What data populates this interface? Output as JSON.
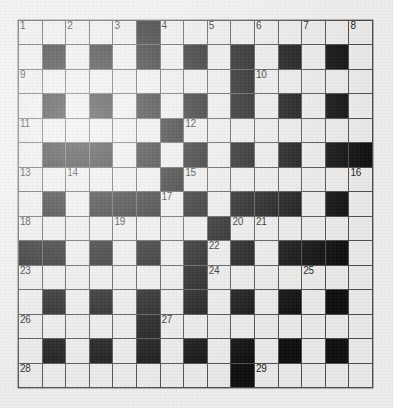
{
  "puzzle": {
    "title": "Crossword Grid",
    "rows": 15,
    "columns": 15,
    "colors": {
      "background": "#f2f1ef",
      "cell_white": "#eeedeb",
      "cell_black": "#0b0b0b",
      "grid_line": "#4a4a4a",
      "number_text": "#161616"
    },
    "grid": [
      [
        "w",
        "w",
        "w",
        "w",
        "w",
        "b",
        "w",
        "w",
        "w",
        "w",
        "w",
        "w",
        "w",
        "w",
        "w"
      ],
      [
        "w",
        "b",
        "w",
        "b",
        "w",
        "b",
        "w",
        "b",
        "w",
        "b",
        "w",
        "b",
        "w",
        "b",
        "w"
      ],
      [
        "w",
        "w",
        "w",
        "w",
        "w",
        "w",
        "w",
        "w",
        "w",
        "b",
        "w",
        "w",
        "w",
        "w",
        "w"
      ],
      [
        "w",
        "b",
        "w",
        "b",
        "w",
        "b",
        "w",
        "b",
        "w",
        "b",
        "w",
        "b",
        "w",
        "b",
        "w"
      ],
      [
        "w",
        "w",
        "w",
        "w",
        "w",
        "w",
        "b",
        "w",
        "w",
        "w",
        "w",
        "w",
        "w",
        "w",
        "w"
      ],
      [
        "w",
        "b",
        "b",
        "b",
        "w",
        "b",
        "w",
        "b",
        "w",
        "b",
        "w",
        "b",
        "w",
        "b",
        "b"
      ],
      [
        "w",
        "w",
        "w",
        "w",
        "w",
        "w",
        "b",
        "w",
        "w",
        "w",
        "w",
        "w",
        "w",
        "w",
        "w"
      ],
      [
        "w",
        "b",
        "w",
        "b",
        "b",
        "b",
        "w",
        "b",
        "w",
        "b",
        "b",
        "b",
        "w",
        "b",
        "w"
      ],
      [
        "w",
        "w",
        "w",
        "w",
        "w",
        "w",
        "w",
        "w",
        "b",
        "w",
        "w",
        "w",
        "w",
        "w",
        "w"
      ],
      [
        "b",
        "b",
        "w",
        "b",
        "w",
        "b",
        "w",
        "b",
        "w",
        "b",
        "w",
        "b",
        "b",
        "b",
        "w"
      ],
      [
        "w",
        "w",
        "w",
        "w",
        "w",
        "w",
        "w",
        "b",
        "w",
        "w",
        "w",
        "w",
        "w",
        "w",
        "w"
      ],
      [
        "w",
        "b",
        "w",
        "b",
        "w",
        "b",
        "w",
        "b",
        "w",
        "b",
        "w",
        "b",
        "w",
        "b",
        "w"
      ],
      [
        "w",
        "w",
        "w",
        "w",
        "w",
        "b",
        "w",
        "w",
        "w",
        "w",
        "w",
        "w",
        "w",
        "w",
        "w"
      ],
      [
        "w",
        "b",
        "w",
        "b",
        "w",
        "b",
        "w",
        "b",
        "w",
        "b",
        "w",
        "b",
        "w",
        "b",
        "w"
      ],
      [
        "w",
        "w",
        "w",
        "w",
        "w",
        "w",
        "w",
        "w",
        "w",
        "b",
        "w",
        "w",
        "w",
        "w",
        "w"
      ]
    ],
    "numbers": [
      {
        "row": 0,
        "col": 0,
        "label": "1"
      },
      {
        "row": 0,
        "col": 2,
        "label": "2"
      },
      {
        "row": 0,
        "col": 4,
        "label": "3"
      },
      {
        "row": 0,
        "col": 6,
        "label": "4"
      },
      {
        "row": 0,
        "col": 8,
        "label": "5"
      },
      {
        "row": 0,
        "col": 10,
        "label": "6"
      },
      {
        "row": 0,
        "col": 12,
        "label": "7"
      },
      {
        "row": 0,
        "col": 14,
        "label": "8"
      },
      {
        "row": 2,
        "col": 0,
        "label": "9"
      },
      {
        "row": 2,
        "col": 10,
        "label": "10"
      },
      {
        "row": 4,
        "col": 0,
        "label": "11"
      },
      {
        "row": 4,
        "col": 7,
        "label": "12"
      },
      {
        "row": 6,
        "col": 0,
        "label": "13"
      },
      {
        "row": 6,
        "col": 2,
        "label": "14"
      },
      {
        "row": 6,
        "col": 7,
        "label": "15"
      },
      {
        "row": 6,
        "col": 14,
        "label": "16"
      },
      {
        "row": 7,
        "col": 6,
        "label": "17"
      },
      {
        "row": 8,
        "col": 0,
        "label": "18"
      },
      {
        "row": 8,
        "col": 4,
        "label": "19"
      },
      {
        "row": 8,
        "col": 9,
        "label": "20"
      },
      {
        "row": 8,
        "col": 10,
        "label": "21"
      },
      {
        "row": 9,
        "col": 8,
        "label": "22"
      },
      {
        "row": 10,
        "col": 0,
        "label": "23"
      },
      {
        "row": 10,
        "col": 8,
        "label": "24"
      },
      {
        "row": 10,
        "col": 12,
        "label": "25"
      },
      {
        "row": 12,
        "col": 0,
        "label": "26"
      },
      {
        "row": 12,
        "col": 6,
        "label": "27"
      },
      {
        "row": 14,
        "col": 0,
        "label": "28"
      },
      {
        "row": 14,
        "col": 10,
        "label": "29"
      }
    ],
    "letters": []
  }
}
